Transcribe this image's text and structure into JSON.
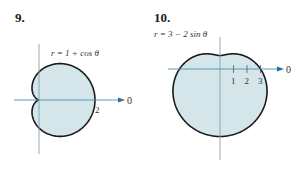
{
  "figures": [
    {
      "number": "9.",
      "equation": "r = 1 + cos θ",
      "axis_label": "0",
      "tick_labels": [
        "2"
      ]
    },
    {
      "number": "10.",
      "equation": "r = 3 − 2 sin θ",
      "axis_label": "0",
      "tick_labels": [
        "1",
        "2",
        "3"
      ]
    }
  ],
  "colors": {
    "fill": "#d4e6ea",
    "curve": "#1a1a1a",
    "axis": "#4a90b8",
    "text": "#333333"
  },
  "chart_data": [
    {
      "type": "polar-curve",
      "title": "9.",
      "equation": "r = 1 + cos θ",
      "curve": "cardioid",
      "polar_axis_label": "0",
      "ticks": [
        {
          "r": 2,
          "label": "2"
        }
      ],
      "r_max": 2
    },
    {
      "type": "polar-curve",
      "title": "10.",
      "equation": "r = 3 − 2 sin θ",
      "curve": "limaçon (dimpled)",
      "polar_axis_label": "0",
      "ticks": [
        {
          "r": 1,
          "label": "1"
        },
        {
          "r": 2,
          "label": "2"
        },
        {
          "r": 3,
          "label": "3"
        }
      ],
      "r_max": 5
    }
  ]
}
